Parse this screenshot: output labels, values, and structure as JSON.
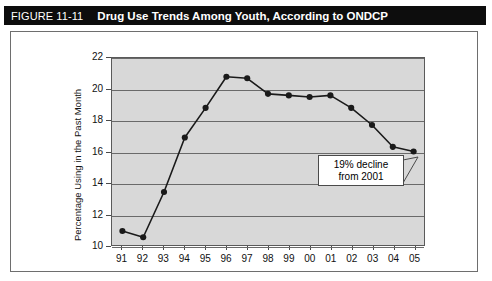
{
  "figure": {
    "number": "FIGURE 11-11",
    "title": "Drug Use Trends Among Youth, According to ONDCP"
  },
  "annotation": {
    "line1": "19% decline",
    "line2": "from 2001"
  },
  "chart_data": {
    "type": "line",
    "title": "Drug Use Trends Among Youth, According to ONDCP",
    "xlabel": "",
    "ylabel": "Percentage Using in the Past Month",
    "categories": [
      "91",
      "92",
      "93",
      "94",
      "95",
      "96",
      "97",
      "98",
      "99",
      "00",
      "01",
      "02",
      "03",
      "04",
      "05"
    ],
    "values": [
      10.9,
      10.5,
      13.4,
      16.9,
      18.8,
      20.8,
      20.7,
      19.7,
      19.6,
      19.5,
      19.6,
      18.8,
      17.7,
      16.3,
      16.0
    ],
    "ylim": [
      10,
      22
    ],
    "yticks": [
      10,
      12,
      14,
      16,
      18,
      20,
      22
    ],
    "grid": true,
    "legend": "none",
    "marker": "filled-circle",
    "line_color": "#1a1a1a",
    "plot_background": "#d8d8d8",
    "annotations": [
      {
        "text": "19% decline from 2001",
        "points_to_category": "05",
        "points_to_value": 16.0
      }
    ]
  }
}
